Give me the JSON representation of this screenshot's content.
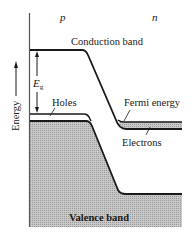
{
  "diagram": {
    "type": "pn-junction-band-diagram",
    "region_labels": {
      "p": "p",
      "n": "n"
    },
    "band_labels": {
      "conduction": "Conduction band",
      "valence": "Valence band",
      "fermi": "Fermi energy",
      "holes": "Holes",
      "electrons": "Electrons"
    },
    "gap_label": {
      "main": "E",
      "sub": "g"
    },
    "axis_label": "Energy",
    "colors": {
      "line": "#1a1a1a",
      "shade_valence": "#b8b8b8",
      "shade_electrons": "#c4c4c4",
      "background": "#ffffff"
    }
  }
}
